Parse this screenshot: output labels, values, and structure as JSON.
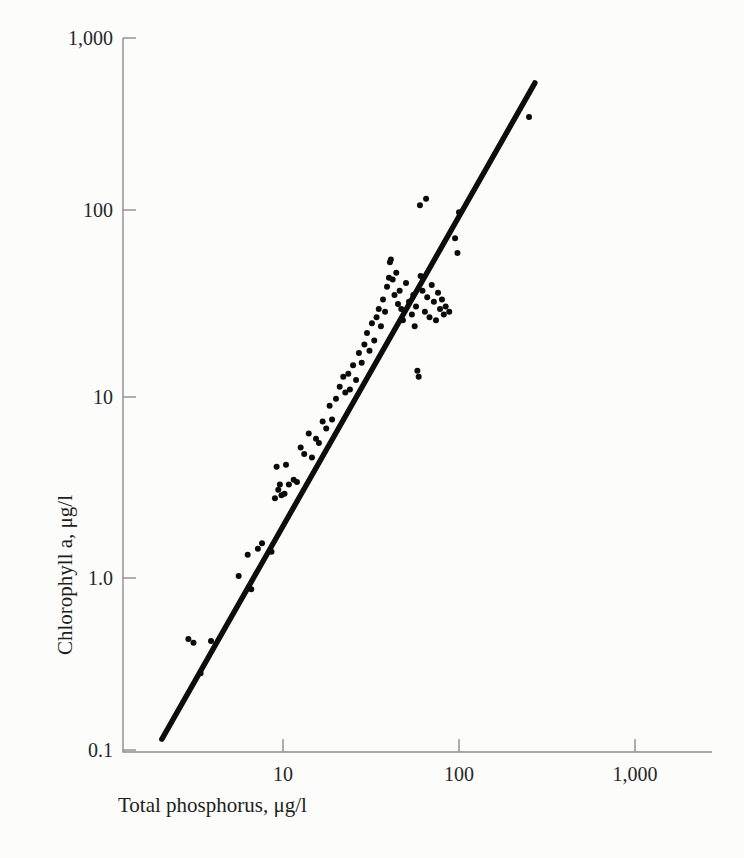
{
  "figure": {
    "background_color": "#fcfcfa",
    "ink_color": "#0b0b0b",
    "axis_color": "#8d8d8d"
  },
  "chart_data": {
    "type": "scatter",
    "title": "",
    "xlabel": "Total phosphorus, μg/l",
    "ylabel": "Chlorophyll a, μg/l",
    "xscale": "log",
    "yscale": "log",
    "xlim": [
      1.7,
      3300
    ],
    "ylim": [
      0.1,
      1000
    ],
    "grid": false,
    "legend": null,
    "xticks": [
      10,
      100,
      1000
    ],
    "xtick_labels": [
      "10",
      "100",
      "1,000"
    ],
    "yticks": [
      0.1,
      1.0,
      10,
      100,
      1000
    ],
    "ytick_labels": [
      "0.1",
      "1.0",
      "10",
      "100",
      "1,000"
    ],
    "marker": "filled-circle",
    "marker_size_px": 5,
    "series": [
      {
        "name": "lake observations",
        "points": [
          [
            2.9,
            0.42
          ],
          [
            3.1,
            0.4
          ],
          [
            3.4,
            0.27
          ],
          [
            3.9,
            0.41
          ],
          [
            5.6,
            0.95
          ],
          [
            6.3,
            1.25
          ],
          [
            6.6,
            0.8
          ],
          [
            7.2,
            1.35
          ],
          [
            7.6,
            1.45
          ],
          [
            8.6,
            1.3
          ],
          [
            9.0,
            2.6
          ],
          [
            9.2,
            3.9
          ],
          [
            9.4,
            2.9
          ],
          [
            9.6,
            3.1
          ],
          [
            9.8,
            2.7
          ],
          [
            10.2,
            2.75
          ],
          [
            10.4,
            4.0
          ],
          [
            10.8,
            3.1
          ],
          [
            11.5,
            3.3
          ],
          [
            12.0,
            3.2
          ],
          [
            12.6,
            5.0
          ],
          [
            13.2,
            4.6
          ],
          [
            14.0,
            6.0
          ],
          [
            14.6,
            4.4
          ],
          [
            15.4,
            5.6
          ],
          [
            16.0,
            5.3
          ],
          [
            16.8,
            7.0
          ],
          [
            17.6,
            6.4
          ],
          [
            18.4,
            8.6
          ],
          [
            19.0,
            7.2
          ],
          [
            20.0,
            9.4
          ],
          [
            21.0,
            11.0
          ],
          [
            22.0,
            12.5
          ],
          [
            22.6,
            10.2
          ],
          [
            23.5,
            13.0
          ],
          [
            24.0,
            10.6
          ],
          [
            25.0,
            14.5
          ],
          [
            26.0,
            12.0
          ],
          [
            27.0,
            17.0
          ],
          [
            28.0,
            15.0
          ],
          [
            29.0,
            19.0
          ],
          [
            30.0,
            22.0
          ],
          [
            31.0,
            17.5
          ],
          [
            32.0,
            25.0
          ],
          [
            33.0,
            20.0
          ],
          [
            34.0,
            27.0
          ],
          [
            35.0,
            30.0
          ],
          [
            36.0,
            24.0
          ],
          [
            37.0,
            34.0
          ],
          [
            38.0,
            29.0
          ],
          [
            39.0,
            40.0
          ],
          [
            40.0,
            45.0
          ],
          [
            40.5,
            55.0
          ],
          [
            41.0,
            57.0
          ],
          [
            42.0,
            44.0
          ],
          [
            43.0,
            36.0
          ],
          [
            44.0,
            48.0
          ],
          [
            45.0,
            32.0
          ],
          [
            46.0,
            38.0
          ],
          [
            47.0,
            30.0
          ],
          [
            48.0,
            26.0
          ],
          [
            50.0,
            42.0
          ],
          [
            52.0,
            33.0
          ],
          [
            54.0,
            28.0
          ],
          [
            55.0,
            36.0
          ],
          [
            56.0,
            24.0
          ],
          [
            57.0,
            31.0
          ],
          [
            58.0,
            13.5
          ],
          [
            59.0,
            12.5
          ],
          [
            60.0,
            115.0
          ],
          [
            60.5,
            46.0
          ],
          [
            62.0,
            38.0
          ],
          [
            64.0,
            29.0
          ],
          [
            65.0,
            125.0
          ],
          [
            66.0,
            35.0
          ],
          [
            68.0,
            27.0
          ],
          [
            70.0,
            41.0
          ],
          [
            72.0,
            33.0
          ],
          [
            74.0,
            26.0
          ],
          [
            76.0,
            37.0
          ],
          [
            78.0,
            30.0
          ],
          [
            80.0,
            34.0
          ],
          [
            82.0,
            28.0
          ],
          [
            84.0,
            31.0
          ],
          [
            88.0,
            29.0
          ],
          [
            95.0,
            75.0
          ],
          [
            98.0,
            62.0
          ],
          [
            100.0,
            105.0
          ],
          [
            250.0,
            360.0
          ]
        ]
      }
    ],
    "fit_line": {
      "name": "regression line",
      "x_start": 2.05,
      "y_start": 0.115,
      "x_end": 270.0,
      "y_end": 560.0,
      "style": "solid",
      "width_px": 5
    }
  },
  "labels": {
    "y_1000": "1,000",
    "y_100": "100",
    "y_10": "10",
    "y_1": "1.0",
    "y_01": "0.1",
    "x_10": "10",
    "x_100": "100",
    "x_1000": "1,000",
    "x_title": "Total phosphorus, μg/l",
    "y_title": "Chlorophyll a, μg/l"
  }
}
